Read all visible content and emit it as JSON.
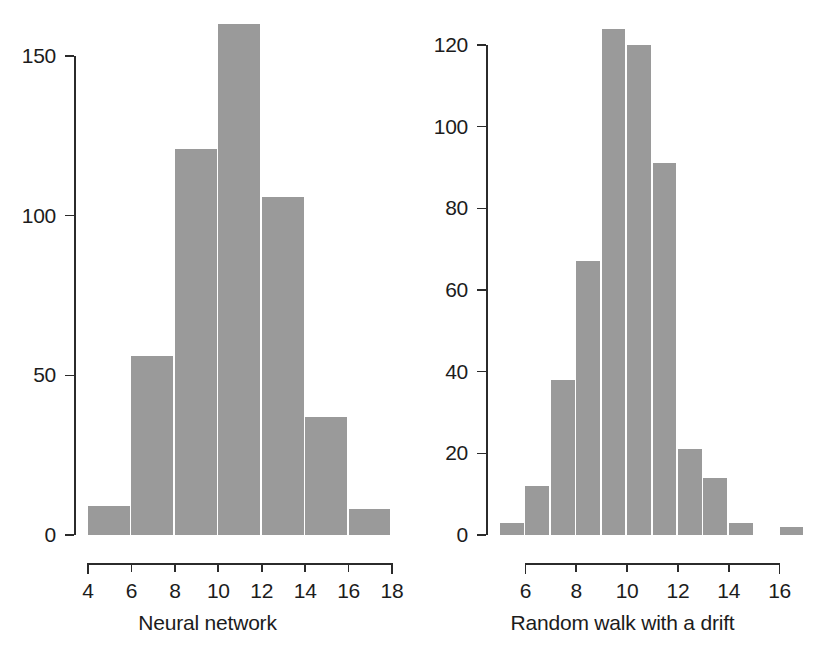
{
  "figure": {
    "background": "#ffffff",
    "bar_color": "#9a9a9a",
    "axis_color": "#2b2b2b",
    "text_color": "#1c1c1c",
    "caption": ""
  },
  "chart_data": [
    {
      "type": "bar",
      "panel": "left",
      "title": "",
      "xlabel": "Neural network",
      "ylabel": "",
      "categories": [
        "4-6",
        "6-8",
        "8-10",
        "10-12",
        "12-14",
        "14-16",
        "16-18"
      ],
      "bin_edges": [
        4,
        6,
        8,
        10,
        12,
        14,
        16,
        18
      ],
      "values": [
        9,
        56,
        121,
        160,
        106,
        37,
        8
      ],
      "xlim": [
        4,
        18
      ],
      "ylim": [
        0,
        160
      ],
      "yticks": [
        0,
        50,
        100,
        150
      ],
      "ytick_labels": [
        "0",
        "50",
        "100",
        "150"
      ],
      "xticks": [
        4,
        6,
        8,
        10,
        12,
        14,
        16,
        18
      ],
      "xtick_labels": [
        "4",
        "6",
        "8",
        "10",
        "12",
        "14",
        "16",
        "18"
      ],
      "grid": false,
      "legend": "none"
    },
    {
      "type": "bar",
      "panel": "right",
      "title": "",
      "xlabel": "Random walk with a drift",
      "ylabel": "",
      "categories": [
        "5-6",
        "6-7",
        "7-8",
        "8-9",
        "9-10",
        "10-11",
        "11-12",
        "12-13",
        "13-14",
        "14-15",
        "15-16",
        "16-17"
      ],
      "bin_edges": [
        5,
        6,
        7,
        8,
        9,
        10,
        11,
        12,
        13,
        14,
        15,
        16,
        17
      ],
      "values": [
        3,
        12,
        38,
        67,
        124,
        120,
        91,
        21,
        14,
        3,
        0,
        2
      ],
      "xlim": [
        5,
        17
      ],
      "ylim": [
        0,
        124
      ],
      "yticks": [
        0,
        20,
        40,
        60,
        80,
        100,
        120
      ],
      "ytick_labels": [
        "0",
        "20",
        "40",
        "60",
        "80",
        "100",
        "120"
      ],
      "xticks": [
        6,
        8,
        10,
        12,
        14,
        16
      ],
      "xtick_labels": [
        "6",
        "8",
        "10",
        "12",
        "14",
        "16"
      ],
      "grid": false,
      "legend": "none"
    }
  ]
}
